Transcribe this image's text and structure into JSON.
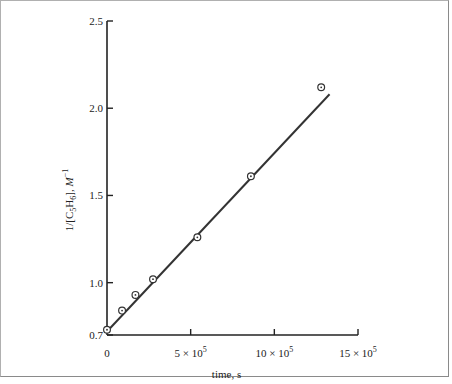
{
  "chart_data": {
    "type": "scatter",
    "title": "",
    "xlabel": "time, s",
    "ylabel": "1/[C5H6], M^-1",
    "ylabel_parts": {
      "pre": "1/[C",
      "sub1": "5",
      "mid": "H",
      "sub2": "6",
      "post": "], ",
      "unit": "M",
      "sup": "−1"
    },
    "xlim": [
      0,
      1500000
    ],
    "ylim": [
      0.7,
      2.5
    ],
    "x_ticks": [
      {
        "value": 0,
        "label": "0"
      },
      {
        "value": 500000,
        "label": "5 × 10",
        "exp": "5"
      },
      {
        "value": 1000000,
        "label": "10 × 10",
        "exp": "5"
      },
      {
        "value": 1500000,
        "label": "15 × 10",
        "exp": "5"
      }
    ],
    "y_ticks": [
      {
        "value": 0.7,
        "label": "0.7"
      },
      {
        "value": 1.0,
        "label": "1.0"
      },
      {
        "value": 1.5,
        "label": "1.5"
      },
      {
        "value": 2.0,
        "label": "2.0"
      },
      {
        "value": 2.5,
        "label": "2.5"
      }
    ],
    "grid": false,
    "legend": null,
    "series": [
      {
        "name": "data",
        "marker": "circle-dot",
        "x": [
          0,
          90000,
          170000,
          275000,
          540000,
          860000,
          1280000
        ],
        "y": [
          0.73,
          0.84,
          0.93,
          1.02,
          1.26,
          1.61,
          2.12
        ]
      },
      {
        "name": "linear fit",
        "type": "line",
        "x": [
          0,
          1330000
        ],
        "y": [
          0.72,
          2.08
        ]
      }
    ]
  }
}
